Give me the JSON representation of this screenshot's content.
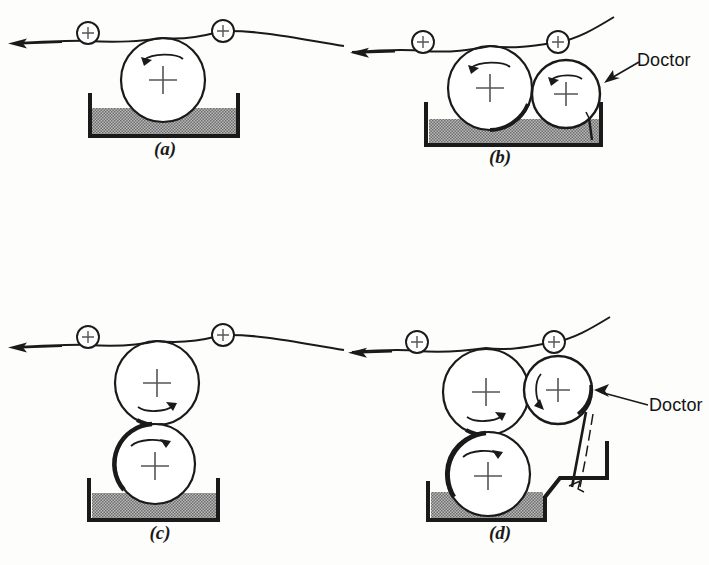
{
  "figure": {
    "background_color": "#fdfdfc",
    "ink_color": "#1a1a1a",
    "liquid_fill_color": "#9a9a9a",
    "pan_wall_color": "#1a1a1a"
  },
  "panels": [
    {
      "id": "a",
      "caption": "(a)",
      "description": "Single applicator roller dipping directly into the coating pan, web passing over the top",
      "roller_count": 1,
      "idler_count": 2,
      "has_doctor_blade": false,
      "has_drain_chute": false,
      "rollers": [
        {
          "name": "applicator-roll",
          "cx": 163,
          "cy": 80,
          "r": 42,
          "rotation": "counterclockwise"
        }
      ],
      "idlers": [
        {
          "name": "idler-roll-left",
          "cx": 88,
          "cy": 33,
          "r": 11
        },
        {
          "name": "idler-roll-right",
          "cx": 223,
          "cy": 31,
          "r": 11
        }
      ],
      "pan": {
        "left": 90,
        "right": 238,
        "top": 95,
        "bottom": 136,
        "liquid_top": 108
      },
      "web_direction": "left"
    },
    {
      "id": "b",
      "caption": "(b)",
      "doctor_label": "Doctor",
      "description": "Applicator roller plus metering roller wiped by a doctor blade standing in the pan",
      "roller_count": 2,
      "idler_count": 2,
      "has_doctor_blade": true,
      "has_drain_chute": false,
      "rollers": [
        {
          "name": "applicator-roll",
          "cx": 490,
          "cy": 88,
          "r": 42,
          "rotation": "counterclockwise"
        },
        {
          "name": "metering-roll",
          "cx": 566,
          "cy": 94,
          "r": 34,
          "rotation": "counterclockwise"
        }
      ],
      "idlers": [
        {
          "name": "idler-roll-left",
          "cx": 423,
          "cy": 42,
          "r": 11
        },
        {
          "name": "idler-roll-right",
          "cx": 558,
          "cy": 42,
          "r": 11
        }
      ],
      "pan": {
        "left": 426,
        "right": 601,
        "top": 104,
        "bottom": 145,
        "liquid_top": 119
      },
      "web_direction": "left"
    },
    {
      "id": "c",
      "caption": "(c)",
      "description": "Two-roll stack: pick-up roller in the pan transfers to the applicator roller under the web",
      "roller_count": 2,
      "idler_count": 2,
      "has_doctor_blade": false,
      "has_drain_chute": false,
      "rollers": [
        {
          "name": "applicator-roll",
          "cx": 157,
          "cy": 383,
          "r": 42,
          "rotation": "clockwise"
        },
        {
          "name": "pickup-roll",
          "cx": 155,
          "cy": 464,
          "r": 40,
          "rotation": "clockwise"
        }
      ],
      "idlers": [
        {
          "name": "idler-roll-left",
          "cx": 88,
          "cy": 337,
          "r": 11
        },
        {
          "name": "idler-roll-right",
          "cx": 223,
          "cy": 335,
          "r": 11
        }
      ],
      "pan": {
        "left": 89,
        "right": 218,
        "top": 480,
        "bottom": 520,
        "liquid_top": 493
      },
      "web_direction": "left"
    },
    {
      "id": "d",
      "caption": "(d)",
      "doctor_label": "Doctor",
      "description": "Three-roll arrangement with a doctored metering roller discharging into a drain chute",
      "roller_count": 3,
      "idler_count": 2,
      "has_doctor_blade": true,
      "has_drain_chute": true,
      "rollers": [
        {
          "name": "applicator-roll",
          "cx": 486,
          "cy": 392,
          "r": 43,
          "rotation": "clockwise"
        },
        {
          "name": "metering-roll",
          "cx": 558,
          "cy": 390,
          "r": 34,
          "rotation": "counterclockwise"
        },
        {
          "name": "pickup-roll",
          "cx": 488,
          "cy": 474,
          "r": 42,
          "rotation": "clockwise"
        }
      ],
      "idlers": [
        {
          "name": "idler-roll-left",
          "cx": 417,
          "cy": 342,
          "r": 11
        },
        {
          "name": "idler-roll-right",
          "cx": 554,
          "cy": 342,
          "r": 11
        }
      ],
      "pan": {
        "left": 428,
        "right": 545,
        "top": 483,
        "bottom": 520,
        "liquid_top": 492
      },
      "web_direction": "left"
    }
  ]
}
